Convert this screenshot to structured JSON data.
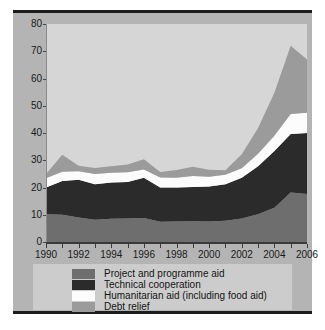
{
  "figure": {
    "background": "#ffffff",
    "panel_color": "#b4b4b4",
    "plot_background": "#d6d6d6",
    "legend_background": "#cccccc",
    "rule_color": "#1c1c1c"
  },
  "legend": {
    "position": "below-plot",
    "entries": [
      {
        "label": "Project and programme aid",
        "color": "#6e6e6e"
      },
      {
        "label": "Technical cooperation",
        "color": "#2b2b2b"
      },
      {
        "label": "Humanitarian aid (including food aid)",
        "color": "#fcfcfc"
      },
      {
        "label": "Debt relief",
        "color": "#9b9b9b"
      }
    ]
  },
  "chart_data": {
    "type": "area",
    "stacked": true,
    "title": "",
    "subtitle": "",
    "xlabel": "",
    "ylabel": "",
    "xlim": [
      1990,
      2006
    ],
    "ylim": [
      0,
      80
    ],
    "grid": false,
    "legend_position": "bottom",
    "x": [
      1990,
      1991,
      1992,
      1993,
      1994,
      1995,
      1996,
      1997,
      1998,
      1999,
      2000,
      2001,
      2002,
      2003,
      2004,
      2005,
      2006
    ],
    "xticks": [
      1990,
      1992,
      1994,
      1996,
      1998,
      2000,
      2002,
      2004,
      2006
    ],
    "xtick_labels": [
      "1990",
      "1992",
      "1994",
      "1996",
      "1998",
      "2000",
      "2002",
      "2004",
      "2006"
    ],
    "yticks": [
      0,
      10,
      20,
      30,
      40,
      50,
      60,
      70,
      80
    ],
    "ytick_labels": [
      "0",
      "10",
      "20",
      "30",
      "40",
      "50",
      "60",
      "70",
      "80"
    ],
    "series": [
      {
        "name": "Project and programme aid",
        "color": "#6e6e6e",
        "values": [
          10.2,
          10.0,
          9.0,
          8.2,
          8.5,
          8.6,
          8.8,
          7.4,
          7.5,
          7.6,
          7.5,
          7.8,
          8.6,
          10.2,
          12.6,
          18.2,
          17.6
        ]
      },
      {
        "name": "Technical cooperation",
        "color": "#2b2b2b",
        "values": [
          9.8,
          12.4,
          13.8,
          13.0,
          13.3,
          13.4,
          14.8,
          12.6,
          12.5,
          12.6,
          12.9,
          13.4,
          15.0,
          17.6,
          20.8,
          21.4,
          22.4
        ]
      },
      {
        "name": "Humanitarian aid (including food aid)",
        "color": "#fcfcfc",
        "values": [
          3.4,
          3.4,
          3.2,
          3.8,
          3.6,
          3.6,
          3.0,
          3.7,
          3.6,
          4.0,
          3.5,
          3.5,
          3.5,
          4.6,
          5.6,
          7.4,
          7.4
        ]
      },
      {
        "name": "Debt relief",
        "color": "#9b9b9b",
        "values": [
          1.6,
          6.2,
          2.0,
          2.2,
          2.4,
          2.8,
          3.8,
          2.0,
          2.8,
          3.4,
          2.6,
          1.6,
          5.1,
          9.4,
          15.8,
          25.0,
          19.6
        ]
      }
    ],
    "totals": [
      25.0,
      32.0,
      28.0,
      27.2,
      27.8,
      28.4,
      30.4,
      25.7,
      26.4,
      27.6,
      26.5,
      26.3,
      32.2,
      41.8,
      54.8,
      72.0,
      67.0
    ]
  }
}
